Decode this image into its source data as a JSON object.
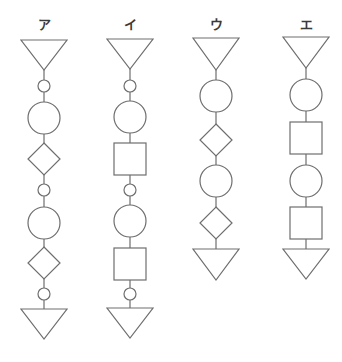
{
  "diagram": {
    "stroke_color": "#6e6e6e",
    "stroke_width": 1.2,
    "columns": [
      {
        "label": "ア",
        "cx": 44,
        "sequence": [
          "triangle-down",
          "small-circle",
          "large-circle",
          "diamond",
          "small-circle",
          "large-circle",
          "diamond",
          "small-circle",
          "triangle-down"
        ],
        "shapes": [
          {
            "type": "triangle-down",
            "top": 40,
            "bottom": 70,
            "half_width": 23
          },
          {
            "type": "small-circle",
            "cy": 86,
            "r": 6
          },
          {
            "type": "large-circle",
            "cy": 118,
            "r": 16
          },
          {
            "type": "diamond",
            "cy": 159,
            "half": 16
          },
          {
            "type": "small-circle",
            "cy": 190,
            "r": 6
          },
          {
            "type": "large-circle",
            "cy": 223,
            "r": 16
          },
          {
            "type": "diamond",
            "cy": 263,
            "half": 16
          },
          {
            "type": "small-circle",
            "cy": 294,
            "r": 6
          },
          {
            "type": "triangle-down",
            "top": 309,
            "bottom": 339,
            "half_width": 23
          }
        ]
      },
      {
        "label": "イ",
        "cx": 130,
        "sequence": [
          "triangle-down",
          "small-circle",
          "large-circle",
          "square",
          "small-circle",
          "large-circle",
          "square",
          "small-circle",
          "triangle-down"
        ],
        "shapes": [
          {
            "type": "triangle-down",
            "top": 39,
            "bottom": 69,
            "half_width": 23
          },
          {
            "type": "small-circle",
            "cy": 86,
            "r": 6
          },
          {
            "type": "large-circle",
            "cy": 117,
            "r": 16
          },
          {
            "type": "square",
            "top": 143,
            "size": 32
          },
          {
            "type": "small-circle",
            "cy": 190,
            "r": 6
          },
          {
            "type": "large-circle",
            "cy": 221,
            "r": 16
          },
          {
            "type": "square",
            "top": 248,
            "size": 32
          },
          {
            "type": "small-circle",
            "cy": 294,
            "r": 6
          },
          {
            "type": "triangle-down",
            "top": 308,
            "bottom": 338,
            "half_width": 23
          }
        ]
      },
      {
        "label": "ウ",
        "cx": 216,
        "sequence": [
          "triangle-down",
          "large-circle",
          "diamond",
          "large-circle",
          "diamond",
          "triangle-down"
        ],
        "shapes": [
          {
            "type": "triangle-down",
            "top": 38,
            "bottom": 70,
            "half_width": 23
          },
          {
            "type": "large-circle",
            "cy": 96,
            "r": 16
          },
          {
            "type": "diamond",
            "cy": 140,
            "half": 16
          },
          {
            "type": "large-circle",
            "cy": 181,
            "r": 16
          },
          {
            "type": "diamond",
            "cy": 223,
            "half": 16
          },
          {
            "type": "triangle-down",
            "top": 249,
            "bottom": 280,
            "half_width": 23
          }
        ]
      },
      {
        "label": "エ",
        "cx": 306,
        "sequence": [
          "triangle-down",
          "large-circle",
          "square",
          "large-circle",
          "square",
          "triangle-down"
        ],
        "shapes": [
          {
            "type": "triangle-down",
            "top": 37,
            "bottom": 68,
            "half_width": 23
          },
          {
            "type": "large-circle",
            "cy": 95,
            "r": 16
          },
          {
            "type": "square",
            "top": 122,
            "size": 32
          },
          {
            "type": "large-circle",
            "cy": 181,
            "r": 16
          },
          {
            "type": "square",
            "top": 207,
            "size": 32
          },
          {
            "type": "triangle-down",
            "top": 249,
            "bottom": 279,
            "half_width": 23
          }
        ]
      }
    ]
  }
}
